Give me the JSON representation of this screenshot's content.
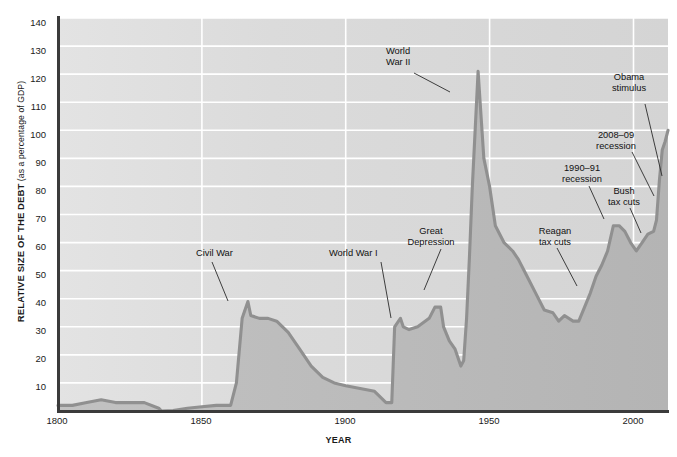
{
  "axes": {
    "ylabel_main": "RELATIVE SIZE OF THE DEBT",
    "ylabel_sub": " (as a percentage of GDP)",
    "xlabel": "YEAR",
    "yticks": [
      "10",
      "20",
      "30",
      "40",
      "50",
      "60",
      "70",
      "80",
      "90",
      "100",
      "110",
      "120",
      "130",
      "140"
    ],
    "xticks": [
      "1800",
      "1850",
      "1900",
      "1950",
      "2000"
    ]
  },
  "annotations": [
    {
      "id": "civil-war",
      "text": "Civil War"
    },
    {
      "id": "world-war-i",
      "text": "World War I"
    },
    {
      "id": "great-depression",
      "text": "Great\nDepression"
    },
    {
      "id": "world-war-ii",
      "text": "World\nWar II"
    },
    {
      "id": "reagan-tax-cuts",
      "text": "Reagan\ntax cuts"
    },
    {
      "id": "recession-1990-91",
      "text": "1990–91\nrecession"
    },
    {
      "id": "bush-tax-cuts",
      "text": "Bush\ntax cuts"
    },
    {
      "id": "recession-2008-09",
      "text": "2008–09\nrecession"
    },
    {
      "id": "obama-stimulus",
      "text": "Obama\nstimulus"
    }
  ],
  "colors": {
    "plot_background": "#d8d8d8",
    "grid": "#ffffff",
    "area_fill": "#b9b9b9",
    "line": "#8c8c8c",
    "axis": "#3a3a3a",
    "text": "#111111"
  },
  "chart_data": {
    "type": "area",
    "title": "",
    "xlabel": "YEAR",
    "ylabel": "RELATIVE SIZE OF THE DEBT (as a percentage of GDP)",
    "xlim": [
      1800,
      2012
    ],
    "ylim": [
      0,
      140
    ],
    "ytick_step": 10,
    "grid": true,
    "legend": false,
    "series": [
      {
        "name": "U.S. federal debt as a percentage of GDP",
        "x": [
          1800,
          1805,
          1810,
          1815,
          1820,
          1825,
          1830,
          1835,
          1836,
          1840,
          1845,
          1850,
          1855,
          1858,
          1860,
          1862,
          1864,
          1866,
          1867,
          1870,
          1873,
          1876,
          1880,
          1884,
          1888,
          1892,
          1896,
          1900,
          1905,
          1910,
          1914,
          1916,
          1917,
          1919,
          1920,
          1922,
          1925,
          1929,
          1931,
          1933,
          1934,
          1936,
          1938,
          1940,
          1941,
          1942,
          1943,
          1944,
          1946,
          1948,
          1950,
          1952,
          1955,
          1958,
          1960,
          1963,
          1966,
          1969,
          1972,
          1974,
          1976,
          1979,
          1981,
          1983,
          1985,
          1987,
          1989,
          1991,
          1993,
          1995,
          1997,
          1999,
          2001,
          2003,
          2005,
          2007,
          2008,
          2009,
          2010,
          2011,
          2012
        ],
        "y": [
          2,
          2,
          3,
          4,
          3,
          3,
          3,
          1,
          0,
          0.2,
          1,
          1.5,
          2,
          2,
          2,
          10,
          33,
          39,
          34,
          33,
          33,
          32,
          28,
          22,
          16,
          12,
          10,
          9,
          8,
          7,
          3,
          3,
          30,
          33,
          30,
          29,
          30,
          33,
          37,
          37,
          30,
          25,
          22,
          16,
          18,
          33,
          55,
          80,
          121,
          90,
          80,
          66,
          60,
          57,
          54,
          48,
          42,
          36,
          35,
          32,
          34,
          32,
          32,
          37,
          42,
          48,
          52,
          57,
          66,
          66,
          64,
          60,
          57,
          60,
          63,
          64,
          68,
          82,
          93,
          96,
          100
        ],
        "units": "percent of GDP"
      }
    ],
    "events": [
      {
        "label": "Civil War",
        "year": 1865,
        "value": 39
      },
      {
        "label": "World War I",
        "year": 1919,
        "value": 33
      },
      {
        "label": "Great Depression",
        "year": 1933,
        "value": 37
      },
      {
        "label": "World War II",
        "year": 1946,
        "value": 121
      },
      {
        "label": "Reagan tax cuts",
        "year": 1982,
        "value": 33
      },
      {
        "label": "1990–91 recession",
        "year": 1991,
        "value": 57
      },
      {
        "label": "Bush tax cuts",
        "year": 2002,
        "value": 58
      },
      {
        "label": "2008–09 recession",
        "year": 2009,
        "value": 82
      },
      {
        "label": "Obama stimulus",
        "year": 2010,
        "value": 93
      }
    ]
  }
}
